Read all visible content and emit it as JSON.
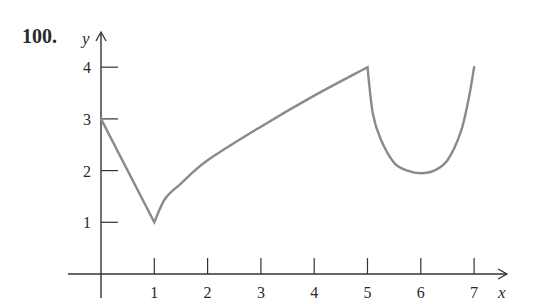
{
  "problem_number": "100.",
  "chart_data": {
    "type": "line",
    "title": "",
    "xlabel": "x",
    "ylabel": "y",
    "x_ticks": [
      "1",
      "2",
      "3",
      "4",
      "5",
      "6",
      "7"
    ],
    "y_ticks": [
      "1",
      "2",
      "3",
      "4"
    ],
    "xlim": [
      0,
      7.7
    ],
    "ylim": [
      0,
      4.5
    ],
    "grid": false,
    "legend": null,
    "series": [
      {
        "name": "f(x)",
        "color": "#8a8a8a",
        "segments": [
          {
            "shape": "linear",
            "points": [
              [
                0,
                3
              ],
              [
                1,
                1
              ]
            ]
          },
          {
            "shape": "concave-increasing",
            "points": [
              [
                1,
                1
              ],
              [
                1.2,
                1.45
              ],
              [
                1.5,
                1.75
              ],
              [
                2,
                2.2
              ],
              [
                3,
                2.85
              ],
              [
                4,
                3.45
              ],
              [
                5,
                4
              ]
            ]
          },
          {
            "shape": "u-curve",
            "points": [
              [
                5,
                4
              ],
              [
                5.1,
                3.1
              ],
              [
                5.25,
                2.6
              ],
              [
                5.5,
                2.15
              ],
              [
                5.75,
                2.0
              ],
              [
                6,
                1.95
              ],
              [
                6.25,
                2.0
              ],
              [
                6.5,
                2.2
              ],
              [
                6.75,
                2.75
              ],
              [
                6.9,
                3.4
              ],
              [
                7,
                4
              ]
            ]
          }
        ]
      }
    ]
  },
  "layout": {
    "origin_px": [
      101,
      274
    ],
    "x_unit_px": 53.3,
    "y_unit_px": 51.7,
    "axis_color": "#333333",
    "curve_color": "#8a8a8a"
  }
}
